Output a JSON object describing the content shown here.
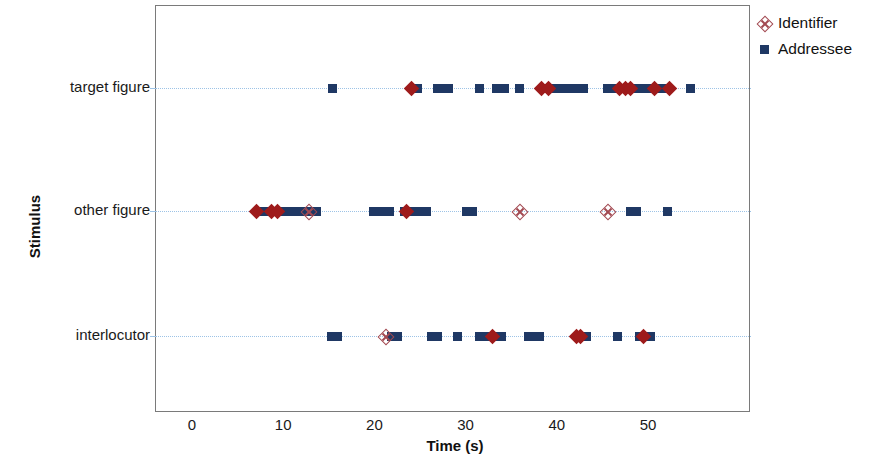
{
  "chart_data": {
    "type": "scatter",
    "title": "",
    "xlabel": "Time (s)",
    "ylabel": "Stimulus",
    "xlim": [
      -3,
      62
    ],
    "xticks": [
      0,
      10,
      20,
      30,
      40,
      50
    ],
    "xticklabels": [
      "0",
      "10",
      "20",
      "30",
      "40",
      "50"
    ],
    "categories": [
      "target figure",
      "other figure",
      "interlocutor"
    ],
    "grid": false,
    "rowlines": true,
    "legend_position": "top-right",
    "colors": {
      "identifier": "#a34a52",
      "identifier_filled": "#9e1b1b",
      "addressee": "#1f3864",
      "rowline": "#9dc3e6",
      "frame": "#7a7a7a"
    },
    "legend": [
      {
        "name": "Identifier",
        "marker": "diamond-open"
      },
      {
        "name": "Addressee",
        "marker": "square-filled"
      }
    ],
    "series": [
      {
        "name": "Addressee",
        "marker": "square-filled",
        "color": "#1f3864",
        "points": [
          {
            "category": "target figure",
            "x": 15.3
          },
          {
            "category": "target figure",
            "x": 24.6
          },
          {
            "category": "target figure",
            "x": 26.8
          },
          {
            "category": "target figure",
            "x": 27.4
          },
          {
            "category": "target figure",
            "x": 28.0
          },
          {
            "category": "target figure",
            "x": 31.4
          },
          {
            "category": "target figure",
            "x": 33.3
          },
          {
            "category": "target figure",
            "x": 34.2
          },
          {
            "category": "target figure",
            "x": 35.8
          },
          {
            "category": "target figure",
            "x": 38.6
          },
          {
            "category": "target figure",
            "x": 39.2
          },
          {
            "category": "target figure",
            "x": 39.8
          },
          {
            "category": "target figure",
            "x": 40.4
          },
          {
            "category": "target figure",
            "x": 41.0
          },
          {
            "category": "target figure",
            "x": 41.6
          },
          {
            "category": "target figure",
            "x": 42.2
          },
          {
            "category": "target figure",
            "x": 42.8
          },
          {
            "category": "target figure",
            "x": 45.4
          },
          {
            "category": "target figure",
            "x": 46.0
          },
          {
            "category": "target figure",
            "x": 46.6
          },
          {
            "category": "target figure",
            "x": 47.2
          },
          {
            "category": "target figure",
            "x": 47.8
          },
          {
            "category": "target figure",
            "x": 48.4
          },
          {
            "category": "target figure",
            "x": 49.0
          },
          {
            "category": "target figure",
            "x": 49.6
          },
          {
            "category": "target figure",
            "x": 50.2
          },
          {
            "category": "target figure",
            "x": 50.8
          },
          {
            "category": "target figure",
            "x": 51.6
          },
          {
            "category": "target figure",
            "x": 54.6
          },
          {
            "category": "other figure",
            "x": 7.8
          },
          {
            "category": "other figure",
            "x": 8.4
          },
          {
            "category": "other figure",
            "x": 9.0
          },
          {
            "category": "other figure",
            "x": 9.6
          },
          {
            "category": "other figure",
            "x": 10.2
          },
          {
            "category": "other figure",
            "x": 10.8
          },
          {
            "category": "other figure",
            "x": 11.4
          },
          {
            "category": "other figure",
            "x": 12.0
          },
          {
            "category": "other figure",
            "x": 12.9
          },
          {
            "category": "other figure",
            "x": 13.5
          },
          {
            "category": "other figure",
            "x": 19.8
          },
          {
            "category": "other figure",
            "x": 20.4
          },
          {
            "category": "other figure",
            "x": 21.0
          },
          {
            "category": "other figure",
            "x": 21.6
          },
          {
            "category": "other figure",
            "x": 23.2
          },
          {
            "category": "other figure",
            "x": 23.8
          },
          {
            "category": "other figure",
            "x": 24.4
          },
          {
            "category": "other figure",
            "x": 25.0
          },
          {
            "category": "other figure",
            "x": 25.6
          },
          {
            "category": "other figure",
            "x": 30.0
          },
          {
            "category": "other figure",
            "x": 30.6
          },
          {
            "category": "other figure",
            "x": 48.0
          },
          {
            "category": "other figure",
            "x": 48.6
          },
          {
            "category": "other figure",
            "x": 52.0
          },
          {
            "category": "interlocutor",
            "x": 15.2
          },
          {
            "category": "interlocutor",
            "x": 15.8
          },
          {
            "category": "interlocutor",
            "x": 21.8
          },
          {
            "category": "interlocutor",
            "x": 22.4
          },
          {
            "category": "interlocutor",
            "x": 26.2
          },
          {
            "category": "interlocutor",
            "x": 26.8
          },
          {
            "category": "interlocutor",
            "x": 29.0
          },
          {
            "category": "interlocutor",
            "x": 31.4
          },
          {
            "category": "interlocutor",
            "x": 32.0
          },
          {
            "category": "interlocutor",
            "x": 32.6
          },
          {
            "category": "interlocutor",
            "x": 33.2
          },
          {
            "category": "interlocutor",
            "x": 33.8
          },
          {
            "category": "interlocutor",
            "x": 36.8
          },
          {
            "category": "interlocutor",
            "x": 37.4
          },
          {
            "category": "interlocutor",
            "x": 38.0
          },
          {
            "category": "interlocutor",
            "x": 42.6
          },
          {
            "category": "interlocutor",
            "x": 43.2
          },
          {
            "category": "interlocutor",
            "x": 46.6
          },
          {
            "category": "interlocutor",
            "x": 49.0
          },
          {
            "category": "interlocutor",
            "x": 49.6
          },
          {
            "category": "interlocutor",
            "x": 50.2
          }
        ]
      },
      {
        "name": "Identifier",
        "marker": "diamond",
        "color": "#9e1b1b",
        "points": [
          {
            "category": "target figure",
            "x": 24.0,
            "filled": true
          },
          {
            "category": "target figure",
            "x": 38.2,
            "filled": true
          },
          {
            "category": "target figure",
            "x": 39.0,
            "filled": true
          },
          {
            "category": "target figure",
            "x": 46.8,
            "filled": true
          },
          {
            "category": "target figure",
            "x": 47.4,
            "filled": true
          },
          {
            "category": "target figure",
            "x": 48.0,
            "filled": true
          },
          {
            "category": "target figure",
            "x": 50.6,
            "filled": true
          },
          {
            "category": "target figure",
            "x": 52.2,
            "filled": true
          },
          {
            "category": "other figure",
            "x": 7.0,
            "filled": true
          },
          {
            "category": "other figure",
            "x": 8.6,
            "filled": true
          },
          {
            "category": "other figure",
            "x": 9.3,
            "filled": true
          },
          {
            "category": "other figure",
            "x": 12.6,
            "filled": false
          },
          {
            "category": "other figure",
            "x": 23.4,
            "filled": true
          },
          {
            "category": "other figure",
            "x": 35.8,
            "filled": false
          },
          {
            "category": "other figure",
            "x": 45.4,
            "filled": false
          },
          {
            "category": "interlocutor",
            "x": 21.0,
            "filled": false
          },
          {
            "category": "interlocutor",
            "x": 32.8,
            "filled": true
          },
          {
            "category": "interlocutor",
            "x": 42.0,
            "filled": true
          },
          {
            "category": "interlocutor",
            "x": 42.5,
            "filled": true
          },
          {
            "category": "interlocutor",
            "x": 49.4,
            "filled": true
          }
        ]
      }
    ]
  }
}
